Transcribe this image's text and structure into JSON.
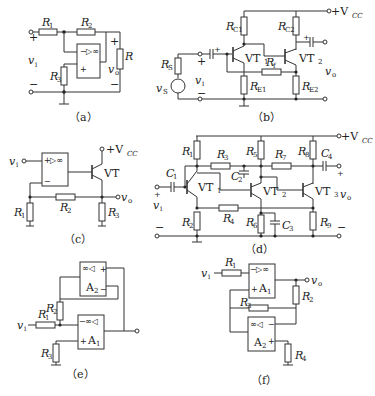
{
  "figure": {
    "panels": [
      {
        "id": "a",
        "caption": "（a）",
        "labels": {
          "R1": "R",
          "R1_sub": "1",
          "R2": "R",
          "R2_sub": "2",
          "R3": "R",
          "R3_sub": "3",
          "RL": "R",
          "vi": "v",
          "vi_sub": "i",
          "vo": "v",
          "vo_sub": "o",
          "opamp": "▷∞",
          "plus": "+",
          "minus": "−"
        }
      },
      {
        "id": "b",
        "caption": "（b）",
        "labels": {
          "Rs": "R",
          "Rs_sub": "S",
          "vs": "v",
          "vs_sub": "S",
          "vi": "v",
          "vi_sub": "i",
          "RC1": "R",
          "RC1_sub": "C1",
          "RC2": "R",
          "RC2_sub": "C2",
          "RE1": "R",
          "RE1_sub": "E1",
          "RE2": "R",
          "RE2_sub": "E2",
          "Rf": "R",
          "Rf_sub": "f",
          "VT1": "VT",
          "VT1_sub": "1",
          "VT2": "VT",
          "VT2_sub": "2",
          "vo": "v",
          "vo_sub": "o",
          "vcc": "+V",
          "vcc_sub": "CC",
          "plus": "+",
          "minus": "−"
        }
      },
      {
        "id": "c",
        "caption": "（c）",
        "labels": {
          "vi": "v",
          "vi_sub": "i",
          "vcc": "+V",
          "vcc_sub": "CC",
          "VT": "VT",
          "R1": "R",
          "R1_sub": "1",
          "R2": "R",
          "R2_sub": "2",
          "R3": "R",
          "R3_sub": "3",
          "vo": "v",
          "vo_sub": "o",
          "opamp": "▷∞",
          "plus": "+",
          "minus": "−"
        }
      },
      {
        "id": "d",
        "caption": "（d）",
        "labels": {
          "vcc": "+V",
          "vcc_sub": "CC",
          "R1": "R",
          "R1_sub": "1",
          "R2": "R",
          "R2_sub": "2",
          "R3": "R",
          "R3_sub": "3",
          "R4": "R",
          "R4_sub": "4",
          "R5": "R",
          "R5_sub": "5",
          "R6": "R",
          "R6_sub": "6",
          "R7": "R",
          "R7_sub": "7",
          "R8": "R",
          "R8_sub": "8",
          "R9": "R",
          "R9_sub": "9",
          "C1": "C",
          "C1_sub": "1",
          "C2": "C",
          "C2_sub": "2",
          "C3": "C",
          "C3_sub": "3",
          "C4": "C",
          "C4_sub": "4",
          "VT1": "VT",
          "VT1_sub": "1",
          "VT2": "VT",
          "VT2_sub": "2",
          "VT3": "VT",
          "VT3_sub": "3",
          "vi": "v",
          "vi_sub": "i",
          "vo": "v",
          "vo_sub": "o",
          "plus": "+",
          "minus": "−"
        }
      },
      {
        "id": "e",
        "caption": "（e）",
        "labels": {
          "vi": "v",
          "vi_sub": "i",
          "R1": "R",
          "R1_sub": "1",
          "R2": "R",
          "R2_sub": "2",
          "R3": "R",
          "R3_sub": "3",
          "A1": "A",
          "A1_sub": "1",
          "A2": "A",
          "A2_sub": "2",
          "opamp": "∞◁",
          "plus": "+",
          "minus": "−"
        }
      },
      {
        "id": "f",
        "caption": "（f）",
        "labels": {
          "vi": "v",
          "vi_sub": "i",
          "R1": "R",
          "R1_sub": "1",
          "R2": "R",
          "R2_sub": "2",
          "R3": "R",
          "R3_sub": "3",
          "R4": "R",
          "R4_sub": "4",
          "A1": "A",
          "A1_sub": "1",
          "A2": "A",
          "A2_sub": "2",
          "vo": "v",
          "vo_sub": "o",
          "opamp1": "▷∞",
          "opamp2": "∞◁",
          "plus": "+",
          "minus": "−"
        }
      }
    ]
  }
}
